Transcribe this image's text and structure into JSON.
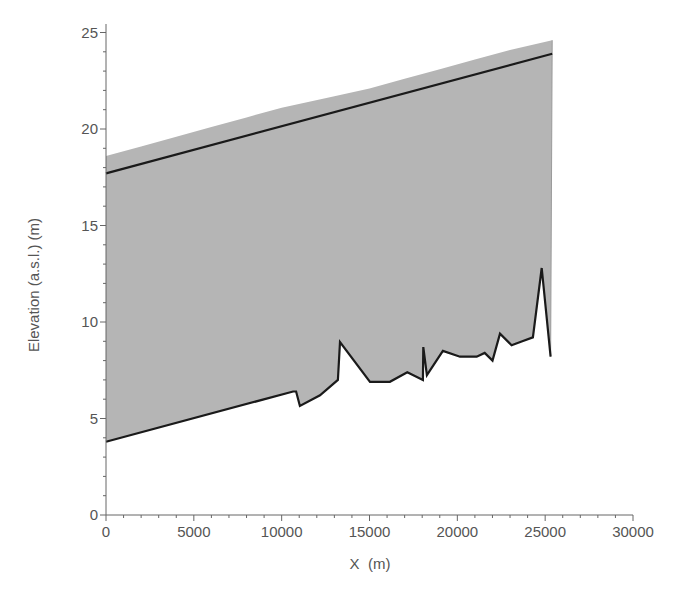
{
  "chart_data": {
    "type": "area",
    "title": "",
    "xlabel": "X  (m)",
    "ylabel": "Elevation (a.s.l.) (m)",
    "xlim": [
      0,
      30000
    ],
    "ylim": [
      0,
      25
    ],
    "x_ticks": [
      0,
      5000,
      10000,
      15000,
      20000,
      25000,
      30000
    ],
    "x_tick_labels": [
      "0",
      "5000",
      "10000",
      "15000",
      "20000",
      "25000",
      "30000"
    ],
    "y_ticks": [
      0,
      5,
      10,
      15,
      20,
      25
    ],
    "y_tick_labels": [
      "0",
      "5",
      "10",
      "15",
      "20",
      "25"
    ],
    "x_minor_step": 1000,
    "y_minor_step": 1,
    "grid": false,
    "legend": null,
    "colors": {
      "fill": "#b5b5b5",
      "line": "#1a1a1a",
      "axis": "#666666",
      "text": "#555555"
    },
    "series": [
      {
        "name": "Upper envelope (gray fill top)",
        "kind": "area-top",
        "x": [
          0,
          2000,
          4000,
          6000,
          8000,
          10000,
          13000,
          15000,
          17000,
          19000,
          21000,
          23000,
          25400
        ],
        "y": [
          18.6,
          19.1,
          19.6,
          20.1,
          20.6,
          21.1,
          21.7,
          22.1,
          22.6,
          23.1,
          23.6,
          24.1,
          24.6
        ]
      },
      {
        "name": "Water surface",
        "kind": "line",
        "x": [
          0,
          25400
        ],
        "y": [
          17.7,
          23.9
        ]
      },
      {
        "name": "Bed profile",
        "kind": "line",
        "x": [
          0,
          10650,
          10820,
          11040,
          12180,
          13200,
          13320,
          15030,
          16160,
          17150,
          18040,
          18060,
          18270,
          19180,
          20150,
          21100,
          21560,
          22000,
          22430,
          23090,
          23700,
          24300,
          24800,
          25310
        ],
        "y": [
          3.8,
          6.4,
          6.4,
          5.65,
          6.2,
          7.0,
          8.96,
          6.9,
          6.9,
          7.4,
          7.0,
          8.7,
          7.25,
          8.5,
          8.2,
          8.2,
          8.4,
          8.0,
          9.4,
          8.8,
          9.0,
          9.2,
          12.8,
          8.2
        ]
      }
    ]
  }
}
